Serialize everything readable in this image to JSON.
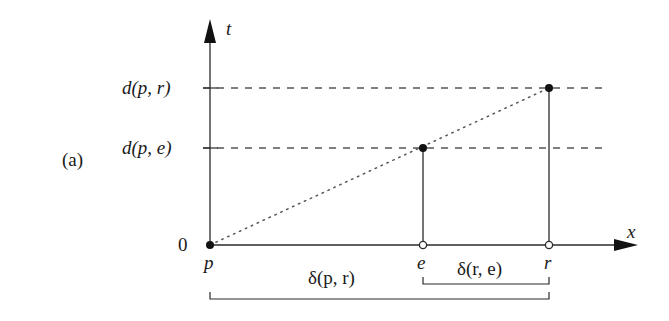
{
  "figure": {
    "panel_label": "(a)",
    "axes": {
      "vertical_label": "t",
      "horizontal_label": "x",
      "origin_label": "0"
    },
    "levels": [
      {
        "label": "d(p, r)",
        "y": 88
      },
      {
        "label": "d(p, e)",
        "y": 148
      }
    ],
    "points": {
      "p": {
        "label": "p",
        "x": 210,
        "y": 245,
        "style": "filled"
      },
      "e": {
        "label": "e",
        "x": 423,
        "y": 245,
        "style": "open"
      },
      "r": {
        "label": "r",
        "x": 549,
        "y": 245,
        "style": "open"
      },
      "e_top": {
        "x": 423,
        "y": 148,
        "style": "filled"
      },
      "r_top": {
        "x": 549,
        "y": 88,
        "style": "filled"
      }
    },
    "brackets": [
      {
        "label": "δ(p, r)",
        "from": "p",
        "to": "r"
      },
      {
        "label": "δ(r, e)",
        "from": "e",
        "to": "r"
      }
    ],
    "colors": {
      "line": "#2a2a2a",
      "dashed": "#555555",
      "dotted": "#555555",
      "text": "#1a1a1a"
    }
  }
}
